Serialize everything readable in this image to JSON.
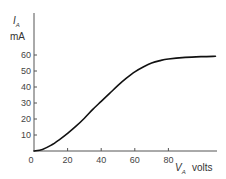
{
  "chart_data": {
    "type": "line",
    "title": "",
    "xlabel": "V_A volts",
    "ylabel": "I_A mA",
    "x_label_main": "V",
    "x_label_sub": "A",
    "x_label_unit": "volts",
    "y_label_main": "I",
    "y_label_sub": "A",
    "y_label_unit": "mA",
    "xlim": [
      0,
      108
    ],
    "ylim": [
      0,
      80
    ],
    "x_ticks": [
      0,
      20,
      40,
      60,
      80
    ],
    "x_tick_labels": [
      "0",
      "20",
      "40",
      "60",
      "80"
    ],
    "y_ticks": [
      10,
      20,
      30,
      40,
      50,
      60
    ],
    "y_tick_labels": [
      "10",
      "20",
      "30",
      "40",
      "50",
      "60"
    ],
    "grid": false,
    "legend": null,
    "series": [
      {
        "name": "anode characteristic",
        "x": [
          0,
          5,
          10,
          15,
          20,
          25,
          30,
          35,
          40,
          45,
          50,
          55,
          60,
          65,
          70,
          75,
          80,
          90,
          100,
          108
        ],
        "values": [
          0,
          1,
          3.5,
          7,
          11,
          15.5,
          20.5,
          26,
          31,
          36,
          41,
          45.5,
          49.5,
          52.5,
          55,
          56.5,
          57.5,
          58.5,
          59,
          59.2
        ]
      }
    ],
    "colors": {
      "line": "#111111",
      "axis": "#555555"
    }
  }
}
